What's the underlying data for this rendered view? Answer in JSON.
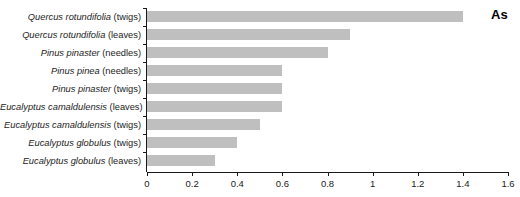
{
  "chart_data": {
    "type": "bar",
    "orientation": "horizontal",
    "title": "",
    "subtitle": "",
    "xlabel": "",
    "ylabel": "",
    "annotation": "As",
    "legend": [
      "As"
    ],
    "legend_position": "top-right",
    "grid": false,
    "xlim": [
      0,
      1.6
    ],
    "xticks": [
      0,
      0.2,
      0.4,
      0.6,
      0.8,
      1,
      1.2,
      1.4,
      1.6
    ],
    "xtick_labels": [
      "0",
      "0.2",
      "0.4",
      "0.6",
      "0.8",
      "1",
      "1.2",
      "1.4",
      "1.6"
    ],
    "bar_color": "#bfbfbf",
    "axis_color": "#1a1a1a",
    "categories": [
      "Quercus rotundifolia (twigs)",
      "Quercus rotundifolia (leaves)",
      "Pinus pinaster (needles)",
      "Pinus pinea (needles)",
      "Pinus pinaster (twigs)",
      "Eucalyptus camaldulensis (leaves)",
      "Eucalyptus camaldulensis (twigs)",
      "Eucalyptus globulus (twigs)",
      "Eucalyptus globulus (leaves)"
    ],
    "values": [
      1.4,
      0.9,
      0.8,
      0.6,
      0.6,
      0.6,
      0.5,
      0.4,
      0.3
    ],
    "series": [
      {
        "name": "As",
        "values": [
          1.4,
          0.9,
          0.8,
          0.6,
          0.6,
          0.6,
          0.5,
          0.4,
          0.3
        ]
      }
    ],
    "rows": [
      {
        "species": "Quercus rotundifolia",
        "part": "(twigs)",
        "value": 1.4
      },
      {
        "species": "Quercus rotundifolia",
        "part": "(leaves)",
        "value": 0.9
      },
      {
        "species": "Pinus pinaster",
        "part": "(needles)",
        "value": 0.8
      },
      {
        "species": "Pinus pinea",
        "part": "(needles)",
        "value": 0.6
      },
      {
        "species": "Pinus pinaster",
        "part": "(twigs)",
        "value": 0.6
      },
      {
        "species": "Eucalyptus camaldulensis",
        "part": "(leaves)",
        "value": 0.6
      },
      {
        "species": "Eucalyptus camaldulensis",
        "part": "(twigs)",
        "value": 0.5
      },
      {
        "species": "Eucalyptus globulus",
        "part": "(twigs)",
        "value": 0.4
      },
      {
        "species": "Eucalyptus globulus",
        "part": "(leaves)",
        "value": 0.3
      }
    ]
  }
}
